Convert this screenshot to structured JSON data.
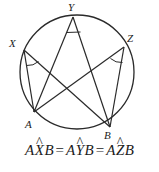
{
  "figure": {
    "circle": {
      "cx": 77,
      "cy": 72,
      "r": 57,
      "stroke": "#2a2a2a"
    },
    "stroke_color": "#2a2a2a",
    "points": [
      {
        "name": "X",
        "label": "X",
        "x": 24,
        "y": 50,
        "label_x": 9,
        "label_y": 38
      },
      {
        "name": "Y",
        "label": "Y",
        "x": 73,
        "y": 17,
        "label_x": 68,
        "label_y": 2
      },
      {
        "name": "Z",
        "label": "Z",
        "x": 124,
        "y": 47,
        "label_x": 127,
        "label_y": 33
      },
      {
        "name": "A",
        "label": "A",
        "x": 34,
        "y": 112,
        "label_x": 25,
        "label_y": 119
      },
      {
        "name": "B",
        "label": "B",
        "x": 110,
        "y": 127,
        "label_x": 104,
        "label_y": 130
      }
    ],
    "segments": [
      {
        "name": "segment-X-A",
        "from": "X",
        "to": "A"
      },
      {
        "name": "segment-X-B",
        "from": "X",
        "to": "B"
      },
      {
        "name": "segment-Y-A",
        "from": "Y",
        "to": "A"
      },
      {
        "name": "segment-Y-B",
        "from": "Y",
        "to": "B"
      },
      {
        "name": "segment-Z-A",
        "from": "Z",
        "to": "A"
      },
      {
        "name": "segment-Z-B",
        "from": "Z",
        "to": "B"
      }
    ],
    "angle_marks": [
      {
        "name": "angle-mark-X",
        "vertex": "X"
      },
      {
        "name": "angle-mark-Y",
        "vertex": "Y"
      },
      {
        "name": "angle-mark-Z",
        "vertex": "Z"
      }
    ]
  },
  "equation": {
    "full_text": "AX̂B = AŶB = AẐB",
    "terms": [
      {
        "pre": "A",
        "vertex": "X",
        "post": "B"
      },
      {
        "pre": "A",
        "vertex": "Y",
        "post": "B"
      },
      {
        "pre": "A",
        "vertex": "Z",
        "post": "B"
      }
    ],
    "relation": "=",
    "hat": "^"
  }
}
